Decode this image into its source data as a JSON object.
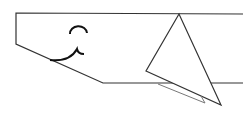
{
  "figure": {
    "stroke_color": "#333333",
    "light_stroke_color": "#777777",
    "mouth_color": "#111111",
    "background": "#ffffff",
    "body": {
      "points": "243,14 16,13 16,44 103,83 243,83"
    },
    "fin": {
      "points": "179,14 146,71 221,105"
    },
    "fin_shadow": {
      "points": "158,84 205,103 201,96"
    },
    "eye": {
      "path": "M70,34 A7,6 0 0 1 87,33"
    },
    "mouth": {
      "path": "M50,60 Q70,62 77,49 Q78,54 84,54"
    }
  }
}
